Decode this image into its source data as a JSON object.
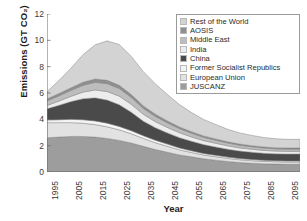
{
  "chart_data": {
    "type": "area",
    "stacked": true,
    "title": "",
    "xlabel": "Year",
    "ylabel": "Emissions (GT CO₂)",
    "xlim": [
      1995,
      2100
    ],
    "ylim": [
      0,
      12
    ],
    "yticks": [
      0,
      2,
      4,
      6,
      8,
      10,
      12
    ],
    "xticks": [
      1995,
      2005,
      2015,
      2025,
      2035,
      2045,
      2055,
      2065,
      2075,
      2085,
      2095
    ],
    "grid": false,
    "legend_position": "top-right",
    "x": [
      1995,
      2000,
      2005,
      2010,
      2015,
      2020,
      2025,
      2030,
      2035,
      2040,
      2045,
      2050,
      2055,
      2060,
      2065,
      2070,
      2075,
      2080,
      2085,
      2090,
      2095,
      2100
    ],
    "series": [
      {
        "name": "JUSCANZ",
        "color": "#9d9d9d",
        "values": [
          2.6,
          2.65,
          2.7,
          2.7,
          2.65,
          2.55,
          2.4,
          2.2,
          1.95,
          1.7,
          1.5,
          1.3,
          1.15,
          1.0,
          0.9,
          0.8,
          0.72,
          0.66,
          0.62,
          0.6,
          0.58,
          0.58
        ]
      },
      {
        "name": "European Union",
        "color": "#e2e2e2",
        "values": [
          1.15,
          1.1,
          1.05,
          1.0,
          0.95,
          0.88,
          0.8,
          0.7,
          0.6,
          0.52,
          0.45,
          0.38,
          0.33,
          0.29,
          0.26,
          0.23,
          0.21,
          0.2,
          0.19,
          0.18,
          0.18,
          0.18
        ]
      },
      {
        "name": "Former Socialist Republics",
        "color": "#f4f4f4",
        "values": [
          0.2,
          0.22,
          0.25,
          0.27,
          0.28,
          0.28,
          0.26,
          0.24,
          0.21,
          0.19,
          0.17,
          0.15,
          0.13,
          0.12,
          0.11,
          0.1,
          0.09,
          0.09,
          0.08,
          0.08,
          0.08,
          0.08
        ]
      },
      {
        "name": "China",
        "color": "#4a4a4a",
        "values": [
          0.85,
          1.1,
          1.35,
          1.6,
          1.75,
          1.75,
          1.65,
          1.4,
          1.1,
          0.95,
          0.85,
          0.78,
          0.72,
          0.67,
          0.63,
          0.6,
          0.57,
          0.55,
          0.53,
          0.52,
          0.52,
          0.52
        ]
      },
      {
        "name": "India",
        "color": "#ededed",
        "values": [
          0.25,
          0.32,
          0.4,
          0.5,
          0.6,
          0.65,
          0.65,
          0.6,
          0.52,
          0.46,
          0.41,
          0.37,
          0.33,
          0.3,
          0.28,
          0.26,
          0.24,
          0.23,
          0.22,
          0.21,
          0.21,
          0.21
        ]
      },
      {
        "name": "Middle East",
        "color": "#bdbdbd",
        "values": [
          0.35,
          0.4,
          0.45,
          0.52,
          0.58,
          0.6,
          0.58,
          0.52,
          0.45,
          0.4,
          0.35,
          0.31,
          0.28,
          0.25,
          0.23,
          0.21,
          0.2,
          0.19,
          0.18,
          0.17,
          0.17,
          0.17
        ]
      },
      {
        "name": "AOSIS",
        "color": "#8f8f8f",
        "values": [
          0.15,
          0.17,
          0.2,
          0.23,
          0.25,
          0.25,
          0.24,
          0.22,
          0.19,
          0.17,
          0.15,
          0.13,
          0.12,
          0.11,
          0.1,
          0.09,
          0.09,
          0.08,
          0.08,
          0.08,
          0.08,
          0.08
        ]
      },
      {
        "name": "Rest of the World",
        "color": "#d3d3d3",
        "values": [
          0.55,
          1.0,
          1.5,
          2.1,
          2.6,
          3.0,
          3.1,
          2.9,
          2.6,
          2.3,
          2.0,
          1.7,
          1.45,
          1.25,
          1.1,
          0.95,
          0.85,
          0.78,
          0.72,
          0.68,
          0.66,
          0.66
        ]
      }
    ],
    "totals": [
      6.1,
      6.96,
      7.9,
      8.92,
      9.66,
      9.96,
      9.68,
      8.78,
      7.62,
      6.69,
      5.88,
      5.12,
      4.51,
      3.99,
      3.61,
      3.24,
      2.97,
      2.78,
      2.62,
      2.52,
      2.48,
      2.48
    ]
  },
  "legend": {
    "entries": [
      {
        "label": "Rest of the World"
      },
      {
        "label": "AOSIS"
      },
      {
        "label": "Middle East"
      },
      {
        "label": "India"
      },
      {
        "label": "China"
      },
      {
        "label": "Former Socialist Republics"
      },
      {
        "label": "European Union"
      },
      {
        "label": "JUSCANZ"
      }
    ]
  },
  "axes": {
    "y_title": "Emissions (GT CO₂)",
    "x_title": "Year",
    "y_tick_labels": [
      "12",
      "10",
      "8",
      "6",
      "4",
      "2",
      "0"
    ],
    "x_tick_labels": [
      "1995",
      "2005",
      "2015",
      "2025",
      "2035",
      "2045",
      "2055",
      "2065",
      "2075",
      "2085",
      "2095"
    ]
  }
}
